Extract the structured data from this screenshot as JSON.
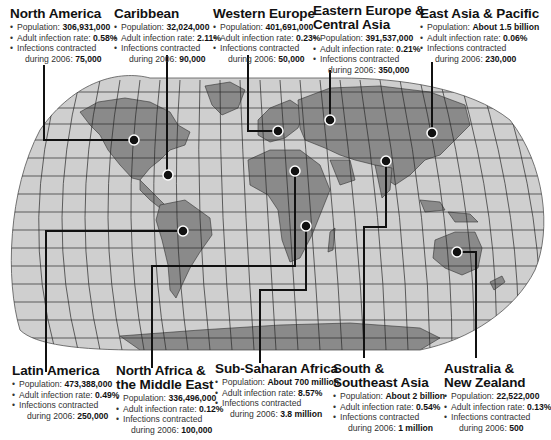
{
  "labels": {
    "population": "Population:",
    "rate": "Adult infection rate:",
    "infections_line1": "Infections contracted",
    "infections_line2": "during 2006:"
  },
  "colors": {
    "ocean": "#cfcfcf",
    "land": "#8a8a8a",
    "grid": "#2a2a2a",
    "leader": "#111111",
    "background": "#ffffff"
  },
  "regions": [
    {
      "name": "North America",
      "name2": "",
      "population": "306,931,000",
      "rate": "0.58%",
      "infections": "75,000"
    },
    {
      "name": "Caribbean",
      "name2": "",
      "population": "32,024,000",
      "rate": "2.11%",
      "infections": "90,000"
    },
    {
      "name": "Western Europe",
      "name2": "",
      "population": "401,691,000",
      "rate": "0.23%",
      "infections": "50,000"
    },
    {
      "name": "Eastern Europe &",
      "name2": "Central Asia",
      "population": "391,537,000",
      "rate": "0.21%",
      "infections": "350,000"
    },
    {
      "name": "East Asia & Pacific",
      "name2": "",
      "population": "About 1.5 billion",
      "rate": "0.06%",
      "infections": "230,000"
    },
    {
      "name": "Latin America",
      "name2": "",
      "population": "473,388,000",
      "rate": "0.49%",
      "infections": "250,000"
    },
    {
      "name": "North Africa &",
      "name2": "the Middle East",
      "population": "336,496,000",
      "rate": "0.12%",
      "infections": "100,000"
    },
    {
      "name": "Sub-Saharan Africa",
      "name2": "",
      "population": "About 700 million",
      "rate": "8.57%",
      "infections": "3.8 million"
    },
    {
      "name": "South &",
      "name2": "Southeast Asia",
      "population": "About 2 billion",
      "rate": "0.54%",
      "infections": "1 million"
    },
    {
      "name": "Australia &",
      "name2": "New Zealand",
      "population": "22,522,000",
      "rate": "0.13%",
      "infections": "500"
    }
  ]
}
